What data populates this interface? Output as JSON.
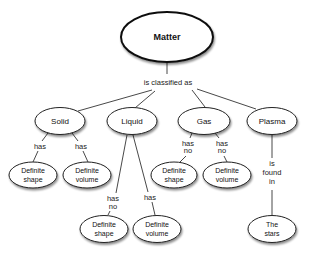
{
  "root": {
    "label": "Matter"
  },
  "root_link": "is classified as",
  "states": [
    {
      "label": "Solid"
    },
    {
      "label": "Liquid"
    },
    {
      "label": "Gas"
    },
    {
      "label": "Plasma"
    }
  ],
  "solid": {
    "links": [
      "has",
      "has"
    ],
    "children": [
      {
        "line1": "Definite",
        "line2": "shape"
      },
      {
        "line1": "Definite",
        "line2": "volume"
      }
    ]
  },
  "liquid": {
    "links": [
      {
        "line1": "has",
        "line2": "no"
      },
      {
        "line1": "has",
        "line2": ""
      }
    ],
    "children": [
      {
        "line1": "Definite",
        "line2": "shape"
      },
      {
        "line1": "Definite",
        "line2": "volume"
      }
    ]
  },
  "gas": {
    "links": [
      {
        "line1": "has",
        "line2": "no"
      },
      {
        "line1": "has",
        "line2": "no"
      }
    ],
    "children": [
      {
        "line1": "Definite",
        "line2": "shape"
      },
      {
        "line1": "Definite",
        "line2": "volume"
      }
    ]
  },
  "plasma": {
    "link": {
      "line1": "is",
      "line2": "found",
      "line3": "in"
    },
    "children": [
      {
        "line1": "The",
        "line2": "stars"
      }
    ]
  }
}
